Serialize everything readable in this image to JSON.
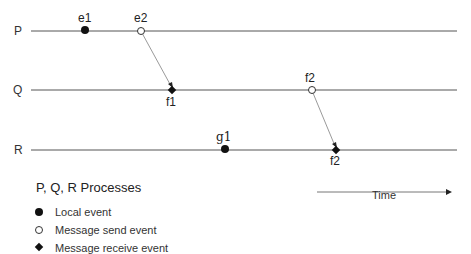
{
  "diagram": {
    "processes": [
      {
        "name": "P",
        "y": 31
      },
      {
        "name": "Q",
        "y": 90
      },
      {
        "name": "R",
        "y": 150
      }
    ],
    "events": [
      {
        "id": "e1",
        "label": "e1",
        "process": "P",
        "type": "local",
        "x": 85
      },
      {
        "id": "e2",
        "label": "e2",
        "process": "P",
        "type": "send",
        "x": 141
      },
      {
        "id": "f1",
        "label": "f1",
        "process": "Q",
        "type": "receive",
        "x": 172
      },
      {
        "id": "f2",
        "label": "f2",
        "process": "Q",
        "type": "send",
        "x": 312
      },
      {
        "id": "g1",
        "label": "g1",
        "process": "R",
        "type": "local",
        "x": 225
      },
      {
        "id": "f2r",
        "label": "f2",
        "process": "R",
        "type": "receive",
        "x": 336
      }
    ],
    "messages": [
      {
        "from": "e2",
        "to": "f1"
      },
      {
        "from": "f2",
        "to": "f2r"
      }
    ],
    "time_axis": {
      "label": "Time",
      "direction": "right"
    }
  },
  "legend": {
    "title": "P, Q, R  Processes",
    "items": [
      {
        "symbol": "filled-circle",
        "label": "Local event"
      },
      {
        "symbol": "hollow-circle",
        "label": "Message send event"
      },
      {
        "symbol": "filled-diamond",
        "label": "Message receive event"
      }
    ]
  },
  "colors": {
    "line": "#555555",
    "message_arrow": "#9a9a9a",
    "marker": "#111111"
  }
}
